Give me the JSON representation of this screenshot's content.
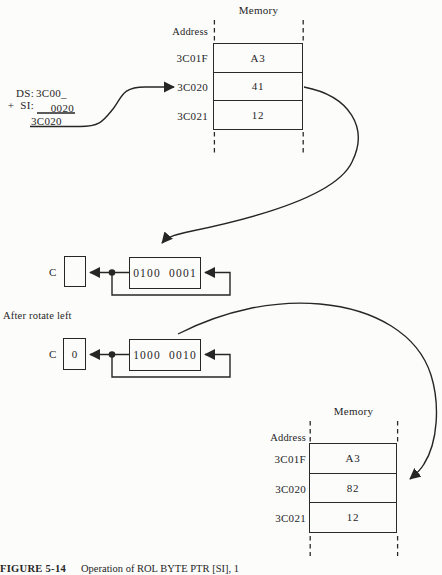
{
  "colors": {
    "ink": "#262626",
    "background": "#fcfcfb"
  },
  "address_calculation": {
    "ds_label": "DS:",
    "ds_value": "3C00_",
    "si_label": "+  SI:",
    "si_value": "0020",
    "sum_value": "3C020"
  },
  "memory_top": {
    "title": "Memory",
    "address_label": "Address",
    "rows": [
      {
        "address": "3C01F",
        "value": "A3"
      },
      {
        "address": "3C020",
        "value": "41"
      },
      {
        "address": "3C021",
        "value": "12"
      }
    ]
  },
  "before_rotate": {
    "carry_label": "C",
    "carry_value": "",
    "register_bits": "0100  0001"
  },
  "after_rotate_label": "After rotate left",
  "after_rotate": {
    "carry_label": "C",
    "carry_value": "0",
    "register_bits": "1000  0010"
  },
  "memory_bottom": {
    "title": "Memory",
    "address_label": "Address",
    "rows": [
      {
        "address": "3C01F",
        "value": "A3"
      },
      {
        "address": "3C020",
        "value": "82"
      },
      {
        "address": "3C021",
        "value": "12"
      }
    ]
  },
  "caption": {
    "figure_number": "FIGURE 5-14",
    "text": "Operation of ROL BYTE PTR [SI], 1"
  }
}
